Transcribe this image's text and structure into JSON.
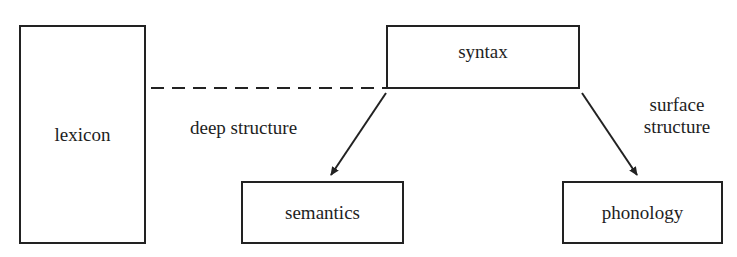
{
  "diagram": {
    "nodes": {
      "lexicon": {
        "label": "lexicon"
      },
      "syntax": {
        "label": "syntax"
      },
      "semantics": {
        "label": "semantics"
      },
      "phonology": {
        "label": "phonology"
      }
    },
    "edges": {
      "lexicon_syntax": {
        "from": "lexicon",
        "to": "syntax",
        "style": "dashed",
        "label": ""
      },
      "deep": {
        "from": "syntax",
        "to": "semantics",
        "style": "arrow",
        "label": "deep structure"
      },
      "surface": {
        "from": "syntax",
        "to": "phonology",
        "style": "arrow",
        "label_line1": "surface",
        "label_line2": "structure"
      }
    },
    "colors": {
      "line": "#222222",
      "text": "#1e1e1e",
      "background": "#ffffff"
    }
  }
}
